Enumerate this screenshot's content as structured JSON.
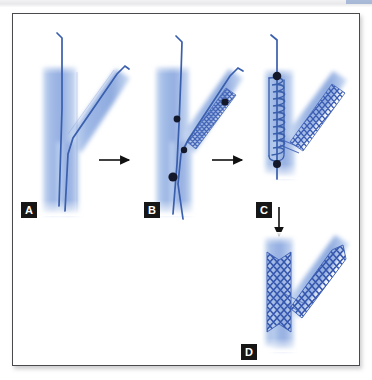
{
  "figure": {
    "panels": [
      {
        "id": "A",
        "label": "A",
        "name": "panel-a-bifurcation-wired",
        "description": "Bifurcated coronary vessel with two guidewires advanced into main and side branch"
      },
      {
        "id": "B",
        "label": "B",
        "name": "panel-b-side-branch-stent-positioned",
        "description": "Crimped stent on balloon catheter positioned across the side branch with radiopaque markers"
      },
      {
        "id": "C",
        "label": "C",
        "name": "panel-c-main-branch-balloon-inflated",
        "description": "Side branch stent deployed and coiled balloon catheter positioned in the main branch"
      },
      {
        "id": "D",
        "label": "D",
        "name": "panel-d-final-result",
        "description": "Final result with both main branch and side branch stents fully deployed"
      }
    ],
    "arrows": [
      {
        "name": "arrow-a-to-b",
        "direction": "right"
      },
      {
        "name": "arrow-b-to-c",
        "direction": "right"
      },
      {
        "name": "arrow-c-to-d",
        "direction": "down"
      }
    ],
    "colors": {
      "vessel_fill": "#9fb9e4",
      "vessel_fill_light": "#c2d3ef",
      "guidewire": "#3a5fad",
      "stent_mesh": "#3556ad",
      "marker": "#14182b",
      "arrow": "#111111",
      "label_badge_bg": "#161616",
      "label_badge_text": "#ffffff",
      "frame_border": "#4a4a4e",
      "background": "#ffffff"
    }
  }
}
